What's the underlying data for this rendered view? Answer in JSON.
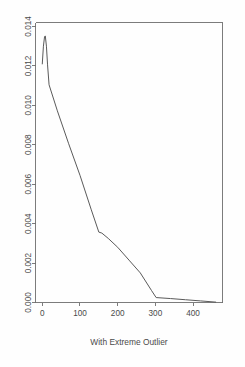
{
  "chart_data": {
    "type": "line",
    "title": "",
    "subtitle": "",
    "xlabel": "With Extreme Outlier",
    "ylabel": "",
    "xlim": [
      -18,
      478
    ],
    "ylim": [
      0.0,
      0.0142
    ],
    "grid": false,
    "legend": null,
    "series": [
      {
        "name": "density",
        "x": [
          0,
          3,
          6,
          8,
          11,
          14,
          18,
          40,
          70,
          100,
          130,
          150,
          158,
          175,
          200,
          230,
          260,
          290,
          302,
          340,
          380,
          420,
          460
        ],
        "y": [
          0.0121,
          0.013,
          0.01348,
          0.01352,
          0.013,
          0.01205,
          0.01104,
          0.00972,
          0.00805,
          0.00645,
          0.0047,
          0.00357,
          0.00352,
          0.00325,
          0.0028,
          0.00215,
          0.0015,
          0.0006,
          0.00025,
          0.0002,
          0.00014,
          8e-05,
          2e-05
        ]
      }
    ],
    "y_ticks": [
      0.0,
      0.002,
      0.004,
      0.006,
      0.008,
      0.01,
      0.012,
      0.014
    ],
    "y_tick_labels": [
      "0.000",
      "0.002",
      "0.004",
      "0.006",
      "0.008",
      "0.010",
      "0.012",
      "0.014"
    ],
    "x_ticks": [
      0,
      100,
      200,
      300,
      400
    ],
    "x_tick_labels": [
      "0",
      "100",
      "200",
      "300",
      "400"
    ],
    "annotations": [],
    "colors": {
      "line": "#5a5a5a",
      "axis": "#6e6e6e",
      "text": "#4a4a4a",
      "background": "#fefefe"
    }
  }
}
